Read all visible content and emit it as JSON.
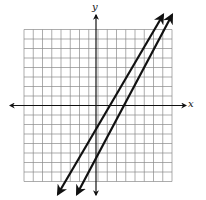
{
  "graph": {
    "type": "coordinate-plane",
    "x_axis_label": "x",
    "y_axis_label": "y",
    "grid": {
      "cols": 16,
      "rows": 16,
      "x_range": [
        -8,
        8
      ],
      "y_range": [
        -8,
        8
      ],
      "unit": 1
    },
    "colors": {
      "grid": "#8a8a8a",
      "axes": "#111111",
      "lines": "#111111",
      "background": "#ffffff"
    },
    "lines": [
      {
        "name": "line-1",
        "approx_equation": "y = 2x - 3",
        "y_intercept": -3,
        "slope": 2,
        "arrows": "both"
      },
      {
        "name": "line-2",
        "approx_equation": "y = 3x - 6",
        "y_intercept": -6,
        "slope": 3,
        "arrows": "both"
      }
    ],
    "intersection": [
      3,
      3
    ]
  }
}
